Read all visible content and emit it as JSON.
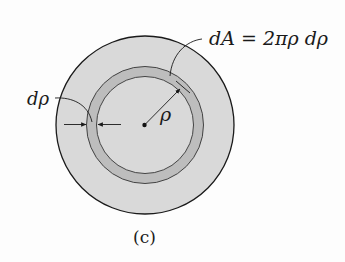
{
  "figure": {
    "caption": "(c)",
    "labels": {
      "area_element": "dA = 2πρ dρ",
      "ring_thickness": "dρ",
      "radius": "ρ"
    },
    "colors": {
      "disk_fill": "#d9d9d9",
      "ring_fill": "#bfbfbf",
      "stroke": "#1a1a1a",
      "background": "#fdfdfd"
    }
  }
}
